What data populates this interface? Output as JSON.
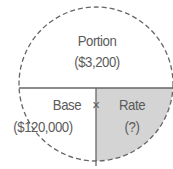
{
  "diagram": {
    "type": "percentage-formula-circle",
    "top": {
      "label": "Portion",
      "value": "($3,200)"
    },
    "bottom_left": {
      "label": "Base",
      "value": "($120,000)"
    },
    "operator": "×",
    "bottom_right": {
      "label": "Rate",
      "value": "(?)"
    },
    "colors": {
      "outline": "#666666",
      "shaded": "#d4d4d4",
      "text": "#5a5a5a"
    }
  }
}
